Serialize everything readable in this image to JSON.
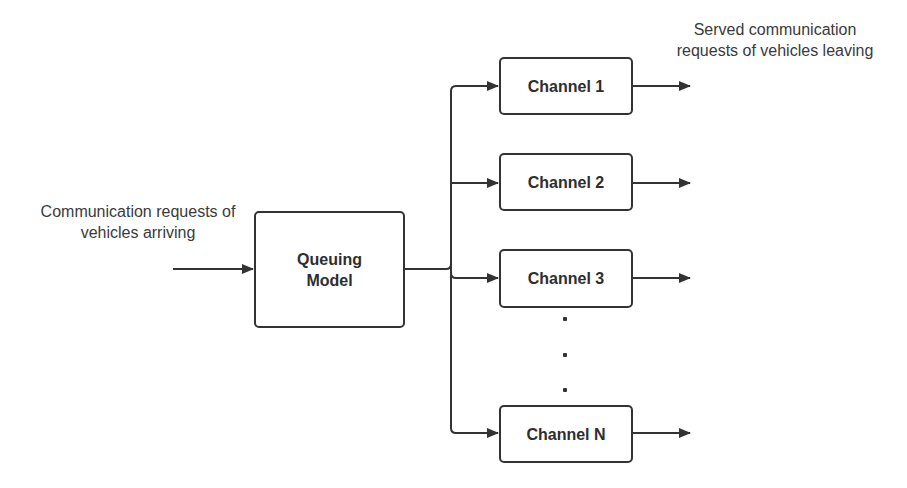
{
  "diagram": {
    "input_label": {
      "line1": "Communication requests of",
      "line2": "vehicles arriving"
    },
    "output_label": {
      "line1": "Served communication",
      "line2": "requests of vehicles leaving"
    },
    "queuing_model": {
      "line1": "Queuing",
      "line2": "Model"
    },
    "channels": [
      {
        "label": "Channel 1"
      },
      {
        "label": "Channel 2"
      },
      {
        "label": "Channel 3"
      },
      {
        "label": "Channel N"
      }
    ],
    "ellipsis": "...",
    "colors": {
      "stroke": "#333333",
      "text": "#2e2e2e",
      "background": "#ffffff"
    }
  }
}
